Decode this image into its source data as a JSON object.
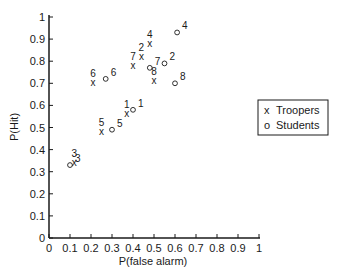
{
  "chart_data": {
    "type": "scatter",
    "title": "",
    "xlabel": "P(false alarm)",
    "ylabel": "P(Hit)",
    "xlim": [
      0,
      1
    ],
    "ylim": [
      0,
      1
    ],
    "grid": false,
    "x_ticks": [
      "0",
      "0.1",
      "0.2",
      "0.3",
      "0.4",
      "0.5",
      "0.6",
      "0.7",
      "0.8",
      "0.9",
      "1"
    ],
    "y_ticks": [
      "0",
      "0.1",
      "0.2",
      "0.3",
      "0.4",
      "0.5",
      "0.6",
      "0.7",
      "0.8",
      "0.9",
      "1"
    ],
    "legend_position": "right",
    "series": [
      {
        "name": "Troopers",
        "marker": "x",
        "points": [
          {
            "label": "1",
            "x": 0.37,
            "y": 0.56
          },
          {
            "label": "2",
            "x": 0.44,
            "y": 0.82
          },
          {
            "label": "3",
            "x": 0.12,
            "y": 0.34
          },
          {
            "label": "4",
            "x": 0.48,
            "y": 0.88
          },
          {
            "label": "5",
            "x": 0.25,
            "y": 0.48
          },
          {
            "label": "6",
            "x": 0.21,
            "y": 0.7
          },
          {
            "label": "7",
            "x": 0.4,
            "y": 0.78
          },
          {
            "label": "8",
            "x": 0.5,
            "y": 0.71
          }
        ]
      },
      {
        "name": "Students",
        "marker": "o",
        "points": [
          {
            "label": "1",
            "x": 0.4,
            "y": 0.58
          },
          {
            "label": "2",
            "x": 0.55,
            "y": 0.79
          },
          {
            "label": "3",
            "x": 0.1,
            "y": 0.33
          },
          {
            "label": "4",
            "x": 0.61,
            "y": 0.93
          },
          {
            "label": "5",
            "x": 0.3,
            "y": 0.49
          },
          {
            "label": "6",
            "x": 0.27,
            "y": 0.72
          },
          {
            "label": "7",
            "x": 0.48,
            "y": 0.77
          },
          {
            "label": "8",
            "x": 0.6,
            "y": 0.7
          }
        ]
      }
    ]
  },
  "legend": {
    "items": [
      {
        "symbol": "x",
        "label": "Troopers"
      },
      {
        "symbol": "o",
        "label": "Students"
      }
    ]
  },
  "colors": {
    "ink": "#1a1a1a",
    "background": "#ffffff"
  }
}
